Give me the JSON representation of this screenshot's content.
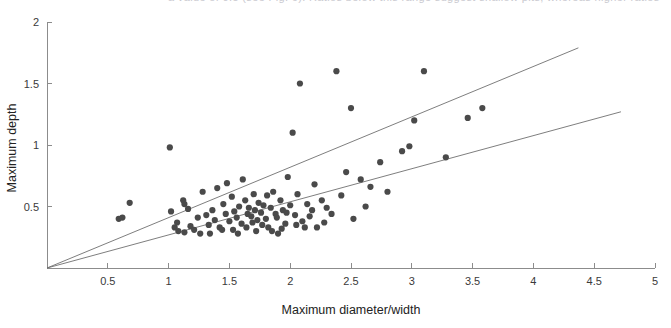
{
  "top_clipped_text": "a value of 0.5 (see Fig. 6). Ratios below this range suggest shallow pits, whereas higher ratios",
  "chart_data": {
    "type": "scatter",
    "title": "",
    "subtitle": "",
    "xlabel": "Maximum diameter/width",
    "ylabel": "Maximum depth",
    "xlim": [
      0,
      5
    ],
    "ylim": [
      0,
      2
    ],
    "xticks": [
      0.5,
      1,
      1.5,
      2,
      2.5,
      3,
      3.5,
      4,
      4.5,
      5
    ],
    "xticklabels": [
      "0.5",
      "1",
      "1.5",
      "2",
      "2.5",
      "3",
      "3.5",
      "4",
      "4.5",
      "5"
    ],
    "yticks": [
      0.5,
      1,
      1.5,
      2
    ],
    "yticklabels": [
      "0.5",
      "1",
      "1.5",
      "2"
    ],
    "grid": false,
    "legend": null,
    "legend_position": "none",
    "marker": {
      "shape": "circle",
      "size": 3.1,
      "color": "#4a4a4a"
    },
    "series": [
      {
        "name": "pits",
        "marker_color": "#4a4a4a",
        "points": [
          [
            0.62,
            0.41
          ],
          [
            0.68,
            0.53
          ],
          [
            1.01,
            0.98
          ],
          [
            1.02,
            0.46
          ],
          [
            1.05,
            0.33
          ],
          [
            1.07,
            0.37
          ],
          [
            1.08,
            0.3
          ],
          [
            1.12,
            0.55
          ],
          [
            1.13,
            0.29
          ],
          [
            1.18,
            0.34
          ],
          [
            1.21,
            0.31
          ],
          [
            1.26,
            0.28
          ],
          [
            1.28,
            0.62
          ],
          [
            1.31,
            0.43
          ],
          [
            1.33,
            0.35
          ],
          [
            1.36,
            0.47
          ],
          [
            1.38,
            0.39
          ],
          [
            1.4,
            0.65
          ],
          [
            1.42,
            0.33
          ],
          [
            1.45,
            0.52
          ],
          [
            1.47,
            0.44
          ],
          [
            1.5,
            0.38
          ],
          [
            1.52,
            0.58
          ],
          [
            1.54,
            0.46
          ],
          [
            1.56,
            0.41
          ],
          [
            1.58,
            0.5
          ],
          [
            1.6,
            0.36
          ],
          [
            1.61,
            0.72
          ],
          [
            1.63,
            0.55
          ],
          [
            1.65,
            0.44
          ],
          [
            1.66,
            0.49
          ],
          [
            1.68,
            0.42
          ],
          [
            1.7,
            0.6
          ],
          [
            1.71,
            0.47
          ],
          [
            1.72,
            0.3
          ],
          [
            1.74,
            0.53
          ],
          [
            1.76,
            0.45
          ],
          [
            1.78,
            0.51
          ],
          [
            1.8,
            0.4
          ],
          [
            1.82,
            0.33
          ],
          [
            1.84,
            0.49
          ],
          [
            1.86,
            0.62
          ],
          [
            1.88,
            0.44
          ],
          [
            1.9,
            0.28
          ],
          [
            1.92,
            0.55
          ],
          [
            1.94,
            0.47
          ],
          [
            1.96,
            0.36
          ],
          [
            1.98,
            0.74
          ],
          [
            2.0,
            0.51
          ],
          [
            2.02,
            1.1
          ],
          [
            2.04,
            0.43
          ],
          [
            2.06,
            0.6
          ],
          [
            2.08,
            1.5
          ],
          [
            2.1,
            0.38
          ],
          [
            2.12,
            0.33
          ],
          [
            2.14,
            0.52
          ],
          [
            2.18,
            0.47
          ],
          [
            2.2,
            0.68
          ],
          [
            2.22,
            0.33
          ],
          [
            2.26,
            0.55
          ],
          [
            2.3,
            0.49
          ],
          [
            2.34,
            0.44
          ],
          [
            2.38,
            1.6
          ],
          [
            2.42,
            0.59
          ],
          [
            2.46,
            0.78
          ],
          [
            2.5,
            1.3
          ],
          [
            2.52,
            0.4
          ],
          [
            2.58,
            0.72
          ],
          [
            2.62,
            0.5
          ],
          [
            2.66,
            0.66
          ],
          [
            2.74,
            0.86
          ],
          [
            2.8,
            0.62
          ],
          [
            2.92,
            0.95
          ],
          [
            2.98,
            0.99
          ],
          [
            3.02,
            1.2
          ],
          [
            3.1,
            1.6
          ],
          [
            3.28,
            0.9
          ],
          [
            3.46,
            1.22
          ],
          [
            3.58,
            1.3
          ],
          [
            1.13,
            0.52
          ],
          [
            1.16,
            0.48
          ],
          [
            1.24,
            0.41
          ],
          [
            1.34,
            0.28
          ],
          [
            1.44,
            0.31
          ],
          [
            1.48,
            0.69
          ],
          [
            1.53,
            0.31
          ],
          [
            1.57,
            0.28
          ],
          [
            1.64,
            0.33
          ],
          [
            1.69,
            0.37
          ],
          [
            1.73,
            0.39
          ],
          [
            1.77,
            0.35
          ],
          [
            1.81,
            0.59
          ],
          [
            1.85,
            0.3
          ],
          [
            1.89,
            0.41
          ],
          [
            1.93,
            0.32
          ],
          [
            1.97,
            0.45
          ],
          [
            2.05,
            0.35
          ],
          [
            2.16,
            0.42
          ],
          [
            2.28,
            0.37
          ],
          [
            0.59,
            0.4
          ]
        ]
      }
    ],
    "trendlines": [
      {
        "name": "upper-envelope",
        "x0": 0.0,
        "y0": 0.0,
        "x1": 4.37,
        "y1": 1.79,
        "slope": 0.41,
        "intercept": 0.0,
        "color": "#6f6f6f"
      },
      {
        "name": "lower-envelope",
        "x0": 0.0,
        "y0": 0.0,
        "x1": 4.72,
        "y1": 1.27,
        "slope": 0.27,
        "intercept": 0.0,
        "color": "#6f6f6f"
      }
    ]
  }
}
